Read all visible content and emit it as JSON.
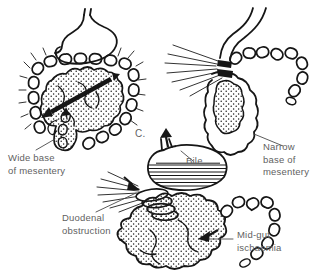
{
  "figure": {
    "type": "medical-line-diagram",
    "colors": {
      "ink": "#161616",
      "label_text": "#5f5f5f",
      "background": "#ffffff"
    },
    "labels": {
      "wide_base": "Wide base\nof mesentery",
      "narrow_base": "Narrow\nbase of\nmesentery",
      "bile": "Bile",
      "duodenal_obstruction": "Duodenal\nobstruction",
      "midgut_ischaemia": "Mid-gut\nischaemia",
      "panel_c": "C."
    }
  }
}
